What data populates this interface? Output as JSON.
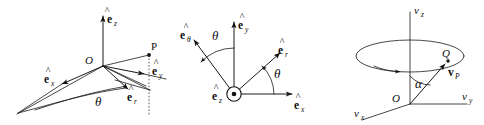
{
  "figure": {
    "background_color": "#ffffff",
    "ink_color": "#111111",
    "width": 484,
    "height": 125
  },
  "panels": [
    {
      "id": "panel-spherical-3d",
      "name": "three-dimensional-unit-vector-diagram",
      "origin_label": "O",
      "point_label": "P",
      "angle_label": "θ",
      "unit_vectors": [
        {
          "name": "e-hat-z",
          "base": "e",
          "subscript": "z",
          "hat": "^"
        },
        {
          "name": "e-hat-x",
          "base": "e",
          "subscript": "x",
          "hat": "^"
        },
        {
          "name": "e-hat-y",
          "base": "e",
          "subscript": "y",
          "hat": "^"
        },
        {
          "name": "e-hat-r",
          "base": "e",
          "subscript": "r",
          "hat": "^"
        }
      ]
    },
    {
      "id": "panel-polar-plane",
      "name": "in-plane-unit-vector-diagram",
      "angle_label_left": "θ",
      "angle_label_right": "θ",
      "out-of-page-marker": "circled-dot",
      "unit_vectors": [
        {
          "name": "e-hat-theta",
          "base": "e",
          "subscript": "θ",
          "hat": "^"
        },
        {
          "name": "e-hat-y",
          "base": "e",
          "subscript": "y",
          "hat": "^"
        },
        {
          "name": "e-hat-r",
          "base": "e",
          "subscript": "r",
          "hat": "^"
        },
        {
          "name": "e-hat-x",
          "base": "e",
          "subscript": "x",
          "hat": "^"
        },
        {
          "name": "e-hat-z",
          "base": "e",
          "subscript": "z",
          "hat": "^"
        }
      ]
    },
    {
      "id": "panel-velocity-cone",
      "name": "velocity-space-cone-diagram",
      "origin_label": "O",
      "point_label": "Q",
      "angle_label": "α",
      "axes": [
        {
          "name": "v-z-axis",
          "base": "v",
          "subscript": "z"
        },
        {
          "name": "v-y-axis",
          "base": "v",
          "subscript": "y"
        },
        {
          "name": "v-x-axis",
          "base": "v",
          "subscript": "x"
        }
      ],
      "vector": {
        "name": "v-P-vector",
        "base": "v",
        "subscript": "P",
        "bold": true
      }
    }
  ]
}
